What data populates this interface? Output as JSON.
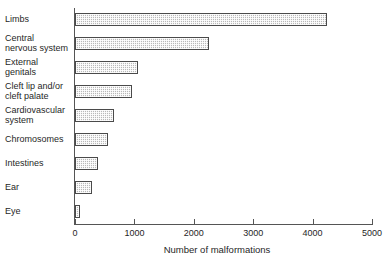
{
  "chart_data": {
    "type": "bar",
    "orientation": "horizontal",
    "title": "",
    "xlabel": "Number of malformations",
    "ylabel": "",
    "categories": [
      "Limbs",
      "Central\nnervous system",
      "External\ngenitals",
      "Cleft lip and/or\ncleft palate",
      "Cardiovascular\nsystem",
      "Chromosomes",
      "Intestines",
      "Ear",
      "Eye"
    ],
    "values": [
      4240,
      2255,
      1060,
      960,
      660,
      555,
      385,
      290,
      85
    ],
    "xlim": [
      0,
      5000
    ],
    "xticks": [
      0,
      1000,
      2000,
      3000,
      4000,
      5000
    ],
    "xtick_labels": [
      "0",
      "1000",
      "2000",
      "3000",
      "4000",
      "5000"
    ],
    "grid": false,
    "legend": false,
    "bar_fill_color": "#d2d2d2",
    "bar_edge_color": "#4a4a4a",
    "axis_color": "#555555",
    "background_color": "#ffffff",
    "text_color": "#1f1f1f"
  }
}
